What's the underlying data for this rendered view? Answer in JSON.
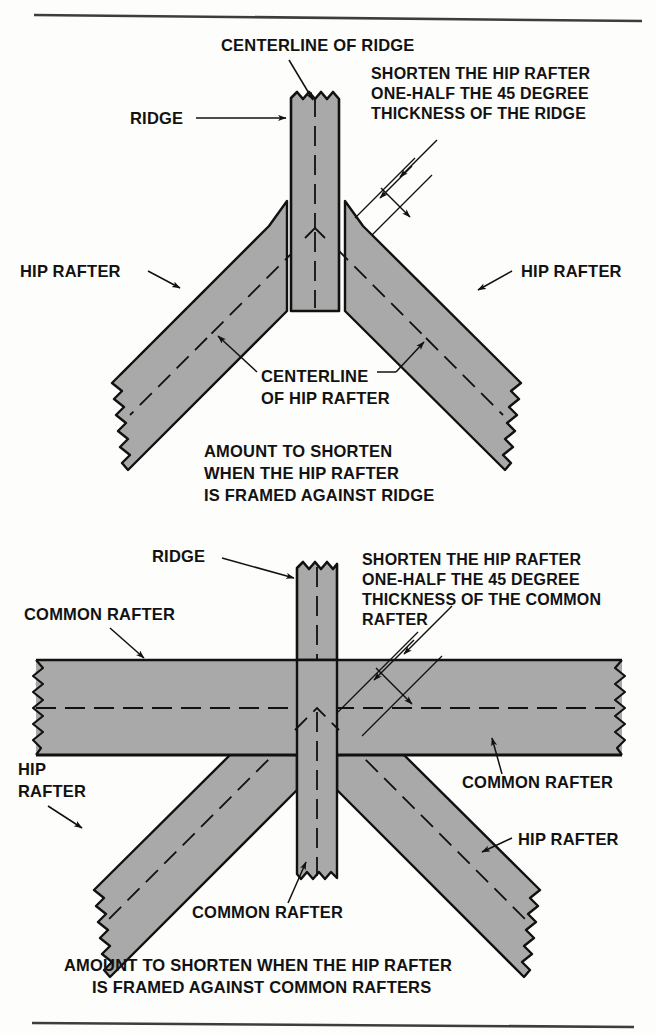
{
  "figure": {
    "domain": "technical-illustration",
    "colors": {
      "lumber_fill": "#a9a9a9",
      "outline": "#111111",
      "background": "#fdfdfb",
      "rule": "#3d3d3d",
      "text": "#121212"
    }
  },
  "top_rule": {
    "name": "top-divider"
  },
  "bottom_rule": {
    "name": "bottom-divider"
  },
  "diagram_top": {
    "caption": [
      "AMOUNT TO SHORTEN",
      "WHEN THE HIP RAFTER",
      "IS FRAMED AGAINST RIDGE"
    ],
    "labels": {
      "centerline_of_ridge": "CENTERLINE OF RIDGE",
      "ridge": "RIDGE",
      "hip_rafter_left": "HIP RAFTER",
      "hip_rafter_right": "HIP RAFTER",
      "centerline_of_hip_rafter": [
        "CENTERLINE",
        "OF HIP RAFTER"
      ],
      "note": [
        "SHORTEN THE HIP RAFTER",
        "ONE-HALF THE 45 DEGREE",
        "THICKNESS OF THE RIDGE"
      ]
    }
  },
  "diagram_bottom": {
    "caption": [
      "AMOUNT TO SHORTEN WHEN THE HIP RAFTER",
      "IS FRAMED AGAINST COMMON RAFTERS"
    ],
    "labels": {
      "ridge": "RIDGE",
      "common_rafter_left": "COMMON RAFTER",
      "common_rafter_right": "COMMON RAFTER",
      "common_rafter_bottom": "COMMON RAFTER",
      "hip_rafter_left": [
        "HIP",
        "RAFTER"
      ],
      "hip_rafter_right": "HIP RAFTER",
      "note": [
        "SHORTEN THE HIP RAFTER",
        "ONE-HALF THE 45 DEGREE",
        "THICKNESS OF THE COMMON",
        "RAFTER"
      ]
    }
  }
}
